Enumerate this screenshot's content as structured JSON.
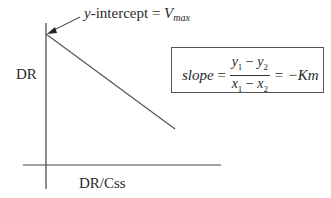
{
  "diagram": {
    "type": "linear-plot",
    "y_axis_label": "DR",
    "x_axis_label": "DR/Css",
    "annotation": {
      "text_prefix": "y",
      "text_middle": "-intercept = ",
      "text_var": "V",
      "text_sub": "max"
    },
    "formula": {
      "lhs": "slope",
      "eq": "=",
      "numerator": [
        "y",
        "1",
        " − ",
        "y",
        "2"
      ],
      "denominator": [
        "x",
        "1",
        " − ",
        "x",
        "2"
      ],
      "rhs": "= −Km"
    },
    "colors": {
      "stroke": "#444444",
      "text": "#2a2a2a"
    }
  }
}
